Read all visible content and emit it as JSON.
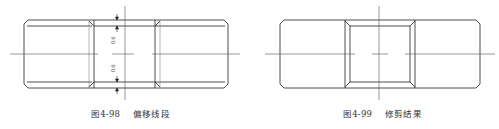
{
  "figures": [
    {
      "id": "fig-4-98",
      "number": "图4-98",
      "title": "偏移线段",
      "dimensions": [
        {
          "label": "0.6"
        },
        {
          "label": "0.6"
        }
      ]
    },
    {
      "id": "fig-4-99",
      "number": "图4-99",
      "title": "修剪结果"
    }
  ],
  "colors": {
    "line": "#222222",
    "centerline": "#555555",
    "text": "#333333",
    "background": "#ffffff"
  }
}
